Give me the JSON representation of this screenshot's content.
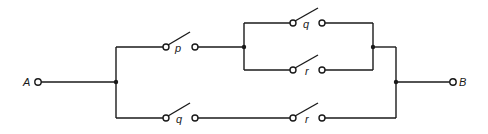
{
  "diagram": {
    "type": "switching-circuit",
    "terminals": {
      "start": "A",
      "end": "B"
    },
    "switches": [
      {
        "id": "sw-p-top",
        "label": "p",
        "branch": "upper"
      },
      {
        "id": "sw-q-upper-inner",
        "label": "q",
        "branch": "upper-parallel-top"
      },
      {
        "id": "sw-r-upper-inner",
        "label": "r",
        "branch": "upper-parallel-bottom"
      },
      {
        "id": "sw-q-lower",
        "label": "q",
        "branch": "lower"
      },
      {
        "id": "sw-r-lower",
        "label": "r",
        "branch": "lower"
      }
    ],
    "colors": {
      "ink": "#1a1a1a",
      "background": "#ffffff"
    }
  }
}
